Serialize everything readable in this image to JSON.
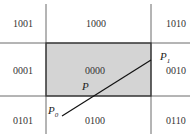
{
  "diagram": {
    "region_codes": {
      "top_left": "1001",
      "top": "1000",
      "top_right": "1010",
      "left": "0001",
      "center": "0000",
      "right": "0010",
      "bottom_left": "0101",
      "bottom": "0100",
      "bottom_right": "0110"
    },
    "points": {
      "p0": {
        "label": "P",
        "sub": "0"
      },
      "p1": {
        "label": "P",
        "sub": "1"
      },
      "p": {
        "label": "P"
      }
    },
    "colors": {
      "window_fill": "#d4d4d4",
      "lines": "#222222"
    }
  }
}
